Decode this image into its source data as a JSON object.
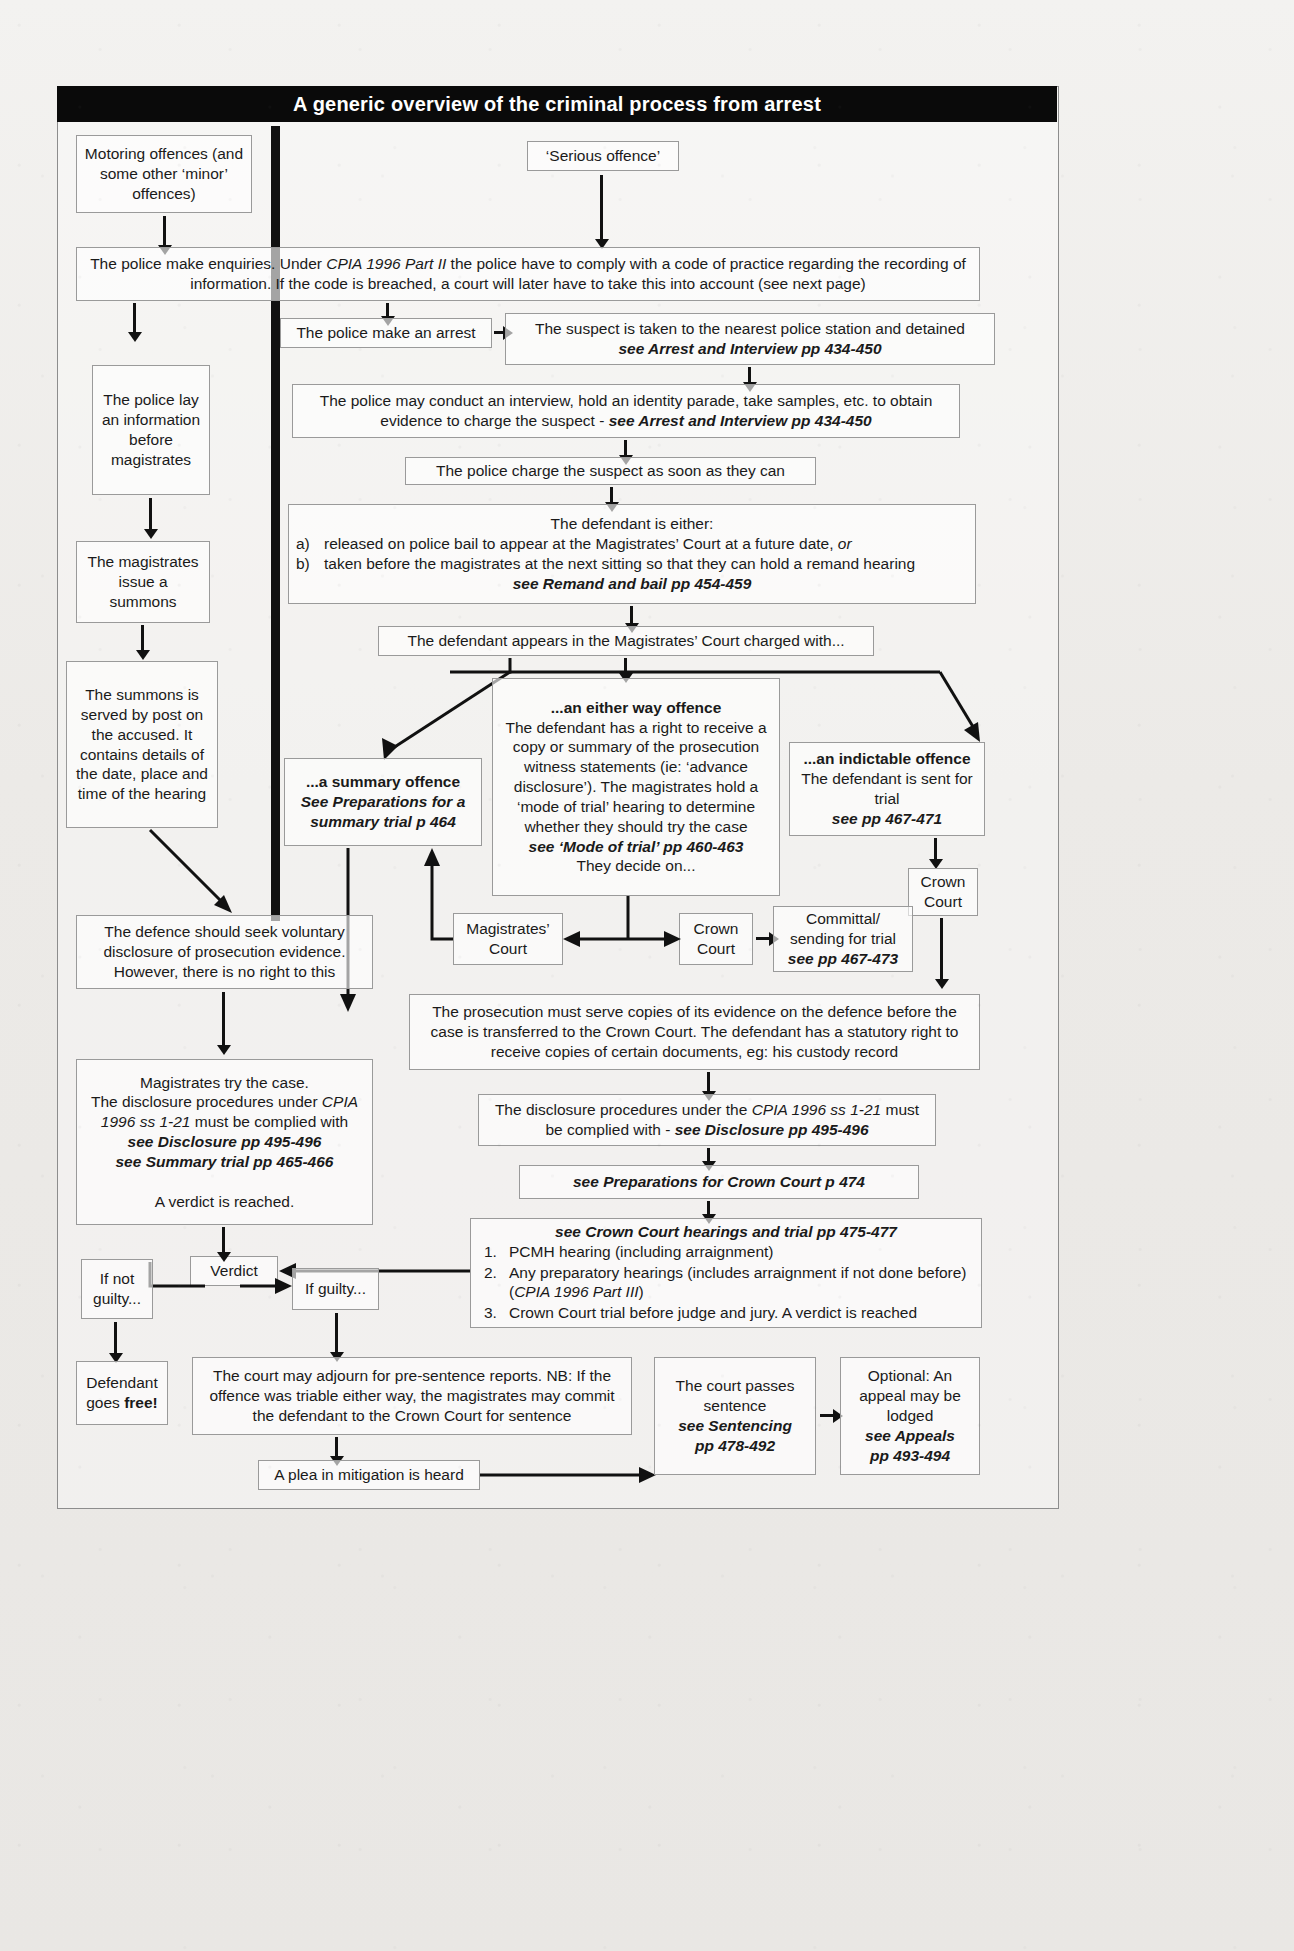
{
  "title": "A generic overview of the criminal process from arrest",
  "nodes": {
    "motoring": "Motoring offences (and some other ‘minor’ offences)",
    "serious": "‘Serious offence’",
    "enquiries_a": "The police make enquiries. Under ",
    "enquiries_em1": "CPIA 1996 Part II",
    "enquiries_b": " the police have to comply with a code of practice regarding the recording of information. If the code is breached, a court will later have to take this into account (see next page)",
    "lay_information": "The police lay an information before magistrates",
    "issue_summons": "The magistrates issue a summons",
    "summons_served": "The summons is served by post on the accused. It contains details of the date, place and time of the hearing",
    "make_arrest": "The police make an arrest",
    "suspect_taken": "The suspect is taken to the nearest police station and detained",
    "suspect_taken_ref": "see Arrest and Interview pp 434-450",
    "interview": "The police may conduct an interview, hold an identity parade, take samples, etc. to obtain evidence to charge the suspect - ",
    "interview_ref": "see Arrest and Interview pp 434-450",
    "charge": "The police charge the suspect as soon as they can",
    "either_head": "The defendant is either:",
    "either_a_mark": "a)",
    "either_a": "released on police bail to appear at the Magistrates’ Court at a future date, ",
    "either_a_or": "or",
    "either_b_mark": "b)",
    "either_b": "taken before the magistrates at the next sitting so that they can hold a remand hearing",
    "either_ref": "see Remand and bail pp 454-459",
    "appears": "The defendant appears in the Magistrates’ Court charged with...",
    "summary_title": "...a summary offence",
    "summary_ref": "See Preparations for a summary trial p 464",
    "eitherway_title": "...an either way offence",
    "eitherway_body": "The defendant has a right to receive a copy or summary of the prosecution witness statements (ie: ‘advance disclosure’). The magistrates hold a ‘mode of trial’ hearing to determine whether they should try the case",
    "eitherway_ref": "see ‘Mode of trial’ pp 460-463",
    "eitherway_tail": "They decide on...",
    "indictable_title": "...an indictable offence",
    "indictable_body": "The defendant is sent for trial",
    "indictable_ref": "see pp 467-471",
    "crown_court_right": "Crown Court",
    "magistrates_court": "Magistrates’ Court",
    "crown_court_mid": "Crown Court",
    "committal": "Committal/ sending for trial",
    "committal_ref": "see pp 467-473",
    "defence_voluntary": "The defence should seek voluntary disclosure of prosecution evidence. However, there is no right to this",
    "prosecution_serve": "The prosecution must serve copies of its evidence on the defence before the case is transferred to the Crown Court. The defendant has a statutory right to receive copies of certain documents, eg: his custody record",
    "mags_try_1": "Magistrates try the case.",
    "mags_try_2a": "The disclosure procedures under ",
    "mags_try_2em": "CPIA 1996 ss 1-21",
    "mags_try_2b": " must be complied with",
    "mags_try_ref1": "see Disclosure pp 495-496",
    "mags_try_ref2": "see Summary trial pp 465-466",
    "mags_try_verdict": "A verdict is reached.",
    "disclosure_cc_a": "The disclosure procedures under the ",
    "disclosure_cc_em": "CPIA 1996 ss 1-21",
    "disclosure_cc_b": " must be complied with - ",
    "disclosure_cc_ref": "see Disclosure pp 495-496",
    "prep_crown": "see Preparations for Crown Court p 474",
    "cc_hearings_ref": "see Crown Court hearings and trial pp 475-477",
    "cc_item1_mark": "1.",
    "cc_item1": "PCMH hearing (including arraignment)",
    "cc_item2_mark": "2.",
    "cc_item2a": "Any preparatory hearings (includes arraignment if not done before) (",
    "cc_item2em": "CPIA 1996 Part III",
    "cc_item2b": ")",
    "cc_item3_mark": "3.",
    "cc_item3": "Crown Court trial before judge and jury. A verdict is reached",
    "verdict": "Verdict",
    "if_not_guilty": "If not guilty...",
    "if_guilty": "If guilty...",
    "defendant_free_a": "Defendant goes ",
    "defendant_free_b": "free!",
    "adjourn": "The court may adjourn for pre-sentence reports. NB: If the offence was triable either way, the magistrates may commit the defendant to the Crown Court for sentence",
    "mitigation": "A plea in mitigation is heard",
    "sentence_a": "The court passes sentence",
    "sentence_ref1": "see Sentencing",
    "sentence_ref2": "pp 478-492",
    "appeal_a": "Optional: An appeal may be lodged",
    "appeal_ref1": "see Appeals",
    "appeal_ref2": "pp 493-494"
  },
  "colors": {
    "title_bar": "#0a0a0a",
    "title_text": "#ffffff",
    "box_border": "#9a9a9a",
    "ink": "#1a1a1a",
    "arrow": "#111111"
  }
}
